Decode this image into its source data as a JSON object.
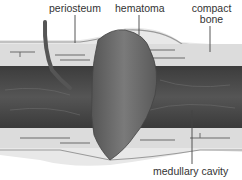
{
  "figure": {
    "labels": {
      "periosteum": "periosteum",
      "hematoma": "hematoma",
      "compact_bone_line1": "compact",
      "compact_bone_line2": "bone",
      "medullary_cavity": "medullary cavity"
    },
    "colors": {
      "background": "#ffffff",
      "outer_tissue": "#e6e6e6",
      "compact_bone": "#d9d9d9",
      "medullary": "#4a4a4a",
      "hematoma": "#6a6a6a",
      "leader_line": "#444444",
      "text": "#333333"
    }
  }
}
